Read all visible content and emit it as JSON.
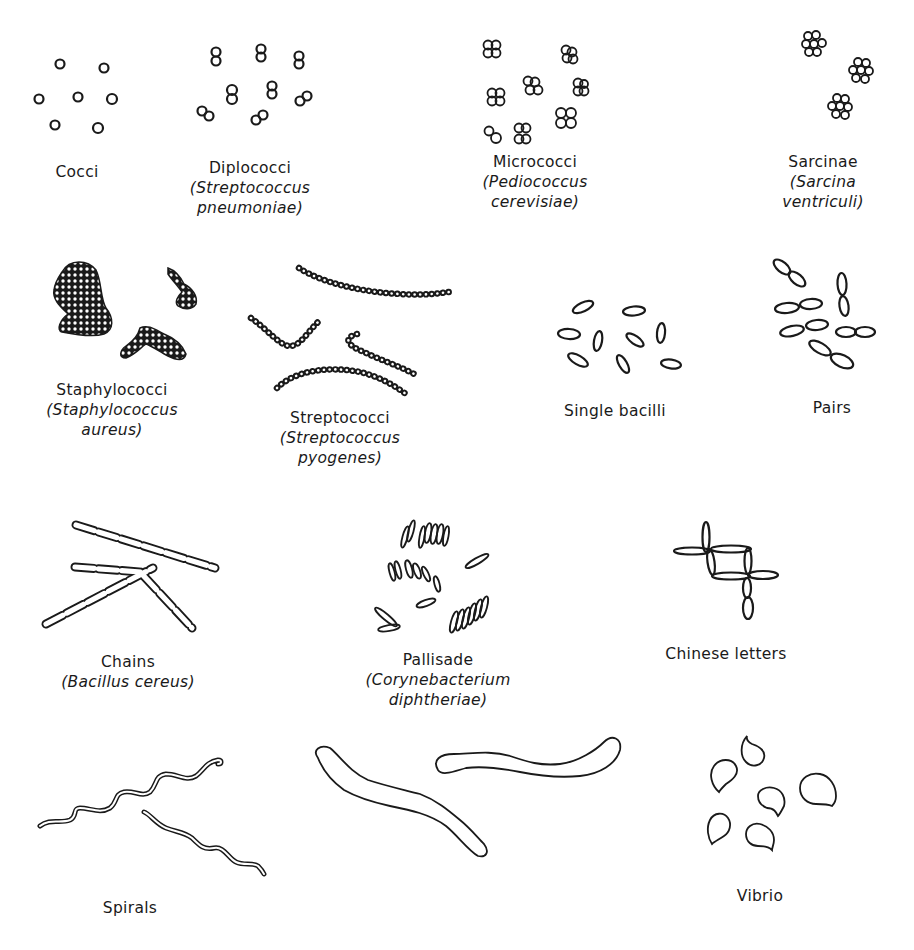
{
  "figure": {
    "panels": [
      {
        "id": "cocci",
        "name": "Cocci",
        "organism_line1": "",
        "organism_line2": ""
      },
      {
        "id": "diplococci",
        "name": "Diplococci",
        "organism_line1": "(Streptococcus",
        "organism_line2": "pneumoniae)"
      },
      {
        "id": "micrococci",
        "name": "Micrococci",
        "organism_line1": "(Pediococcus",
        "organism_line2": "cerevisiae)"
      },
      {
        "id": "sarcinae",
        "name": "Sarcinae",
        "organism_line1": "(Sarcina",
        "organism_line2": "ventriculi)"
      },
      {
        "id": "staphylococci",
        "name": "Staphylococci",
        "organism_line1": "(Staphylococcus",
        "organism_line2": "aureus)"
      },
      {
        "id": "streptococci",
        "name": "Streptococci",
        "organism_line1": "(Streptococcus",
        "organism_line2": "pyogenes)"
      },
      {
        "id": "single-bacilli",
        "name": "Single bacilli",
        "organism_line1": "",
        "organism_line2": ""
      },
      {
        "id": "pairs",
        "name": "Pairs",
        "organism_line1": "",
        "organism_line2": ""
      },
      {
        "id": "chains",
        "name": "Chains",
        "organism_line1": "(Bacillus cereus)",
        "organism_line2": ""
      },
      {
        "id": "pallisade",
        "name": "Pallisade",
        "organism_line1": "(Corynebacterium",
        "organism_line2": "diphtheriae)"
      },
      {
        "id": "chinese-letters",
        "name": "Chinese letters",
        "organism_line1": "",
        "organism_line2": ""
      },
      {
        "id": "spirals",
        "name": "Spirals",
        "organism_line1": "",
        "organism_line2": ""
      },
      {
        "id": "vibrio",
        "name": "Vibrio",
        "organism_line1": "",
        "organism_line2": ""
      }
    ]
  },
  "colors": {
    "ink": "#1a1a1a",
    "background": "#ffffff"
  }
}
